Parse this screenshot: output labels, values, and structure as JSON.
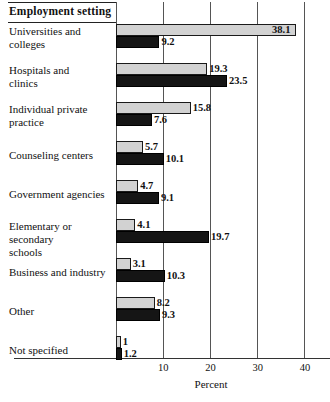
{
  "header": {
    "title": "Employment setting"
  },
  "axis": {
    "xlabel": "Percent",
    "ticks": [
      "10",
      "20",
      "30",
      "40"
    ],
    "tick_values": [
      10,
      20,
      30,
      40
    ],
    "xmin": 0,
    "xmax": 40
  },
  "chart_data": {
    "type": "bar",
    "orientation": "horizontal",
    "title": "Employment setting",
    "xlabel": "Percent",
    "ylabel": "",
    "xlim": [
      0,
      40
    ],
    "grid": true,
    "legend": null,
    "categories": [
      "Universities and colleges",
      "Hospitals and clinics",
      "Individual private practice",
      "Counseling centers",
      "Government agencies",
      "Elementary or secondary schools",
      "Business and industry",
      "Other",
      "Not specified"
    ],
    "series": [
      {
        "name": "light",
        "color": "#d2d2d2",
        "values": [
          38.1,
          19.3,
          15.8,
          5.7,
          4.7,
          4.1,
          3.1,
          8.2,
          1
        ]
      },
      {
        "name": "dark",
        "color": "#151515",
        "values": [
          9.2,
          23.5,
          7.6,
          10.1,
          9.1,
          19.7,
          10.3,
          9.3,
          1.2
        ]
      }
    ],
    "value_labels": {
      "light": [
        "38.1",
        "19.3",
        "15.8",
        "5.7",
        "4.7",
        "4.1",
        "3.1",
        "8.2",
        "1"
      ],
      "dark": [
        "9.2",
        "23.5",
        "7.6",
        "10.1",
        "9.1",
        "19.7",
        "10.3",
        "9.3",
        "1.2"
      ]
    }
  },
  "rows": [
    {
      "label_line1": "Universities and",
      "label_line2": "colleges",
      "light_value": "38.1",
      "dark_value": "9.2"
    },
    {
      "label_line1": "Hospitals and",
      "label_line2": "clinics",
      "light_value": "19.3",
      "dark_value": "23.5"
    },
    {
      "label_line1": "Individual private",
      "label_line2": "practice",
      "light_value": "15.8",
      "dark_value": "7.6"
    },
    {
      "label_line1": "Counseling centers",
      "label_line2": "",
      "light_value": "5.7",
      "dark_value": "10.1"
    },
    {
      "label_line1": "Government agencies",
      "label_line2": "",
      "light_value": "4.7",
      "dark_value": "9.1"
    },
    {
      "label_line1": "Elementary or secondary",
      "label_line2": "schools",
      "light_value": "4.1",
      "dark_value": "19.7"
    },
    {
      "label_line1": "Business and industry",
      "label_line2": "",
      "light_value": "3.1",
      "dark_value": "10.3"
    },
    {
      "label_line1": "Other",
      "label_line2": "",
      "light_value": "8.2",
      "dark_value": "9.3"
    },
    {
      "label_line1": "Not specified",
      "label_line2": "",
      "light_value": "1",
      "dark_value": "1.2"
    }
  ]
}
